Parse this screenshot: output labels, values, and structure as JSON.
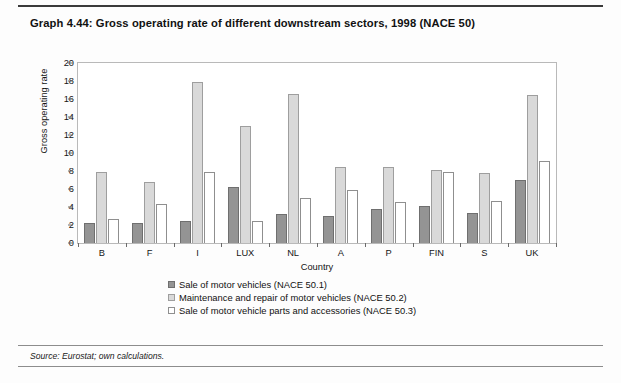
{
  "title": "Graph 4.44: Gross operating rate of different downstream sectors, 1998 (NACE 50)",
  "source": "Source: Eurostat; own calculations.",
  "colors": {
    "series1": "#949494",
    "series2": "#d9d9d9",
    "series3": "#ffffff",
    "frame": "#b9b9b9",
    "rule": "#3a3a3a"
  },
  "chart_data": {
    "type": "bar",
    "title": "Graph 4.44: Gross operating rate of different downstream sectors, 1998 (NACE 50)",
    "xlabel": "Country",
    "ylabel": "Gross operating rate",
    "ylim": [
      0,
      20
    ],
    "yticks": [
      0,
      2,
      4,
      6,
      8,
      10,
      12,
      14,
      16,
      18,
      20
    ],
    "grid": false,
    "legend_position": "below",
    "categories": [
      "B",
      "F",
      "I",
      "LUX",
      "NL",
      "A",
      "P",
      "FIN",
      "S",
      "UK"
    ],
    "series": [
      {
        "name": "Sale of motor vehicles (NACE 50.1)",
        "values": [
          2.2,
          2.2,
          2.4,
          6.2,
          3.2,
          3.0,
          3.8,
          4.1,
          3.3,
          7.0
        ]
      },
      {
        "name": "Maintenance and repair of motor vehicles (NACE 50.2)",
        "values": [
          7.9,
          6.8,
          17.9,
          13.0,
          16.6,
          8.5,
          8.4,
          8.1,
          7.8,
          16.5
        ]
      },
      {
        "name": "Sale of motor vehicle parts and accessories (NACE 50.3)",
        "values": [
          2.7,
          4.3,
          7.9,
          2.5,
          5.0,
          5.9,
          4.6,
          7.9,
          4.7,
          9.1
        ]
      }
    ]
  }
}
